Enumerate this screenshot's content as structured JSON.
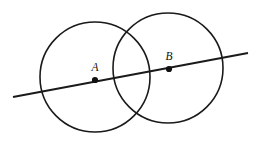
{
  "figure": {
    "canvas": {
      "width": 261,
      "height": 146,
      "background": "#ffffff"
    },
    "stroke_color": "#1a1a1a",
    "label_color": "#111111",
    "circles": [
      {
        "name": "circle-a",
        "center_label": "A",
        "cx": 95,
        "cy": 77,
        "r": 55,
        "stroke_width": 1.6
      },
      {
        "name": "circle-b",
        "center_label": "B",
        "cx": 168,
        "cy": 68,
        "r": 55,
        "stroke_width": 1.6
      }
    ],
    "line": {
      "name": "secant-line",
      "x1": 13,
      "y1": 97,
      "x2": 248,
      "y2": 53,
      "stroke_width": 1.9
    },
    "points": [
      {
        "name": "point-a",
        "label": "A",
        "x": 95,
        "y": 80,
        "radius": 3.1,
        "label_x": 95,
        "label_y": 71
      },
      {
        "name": "point-b",
        "label": "B",
        "x": 169,
        "y": 69,
        "radius": 3.1,
        "label_x": 169,
        "label_y": 60
      }
    ]
  }
}
